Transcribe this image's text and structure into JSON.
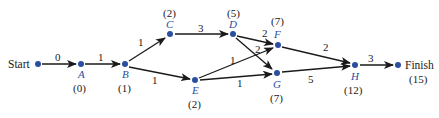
{
  "diagram": {
    "type": "activity-network",
    "colors": {
      "node": "#2b4ea0",
      "edge": "#1a1a1a",
      "text": "#1a1a1a"
    },
    "nodes": {
      "start": {
        "label": "Start"
      },
      "A": {
        "label": "A",
        "time": "(0)"
      },
      "B": {
        "label": "B",
        "time": "(1)"
      },
      "C": {
        "label": "C",
        "time": "(2)"
      },
      "D": {
        "label": "D",
        "time": "(5)"
      },
      "E": {
        "label": "E",
        "time": "(2)"
      },
      "F": {
        "label": "F",
        "time": "(7)"
      },
      "G": {
        "label": "G",
        "time": "(7)"
      },
      "H": {
        "label": "H",
        "time": "(12)"
      },
      "finish": {
        "label": "Finish",
        "time": "(15)"
      }
    },
    "edges": {
      "start_A": "0",
      "A_B": "1",
      "B_C": "1",
      "B_E": "1",
      "C_D": "3",
      "D_F": "2",
      "D_G": "2",
      "E_F": "1",
      "E_G": "1",
      "F_H": "2",
      "G_H": "5",
      "H_finish": "3"
    }
  }
}
